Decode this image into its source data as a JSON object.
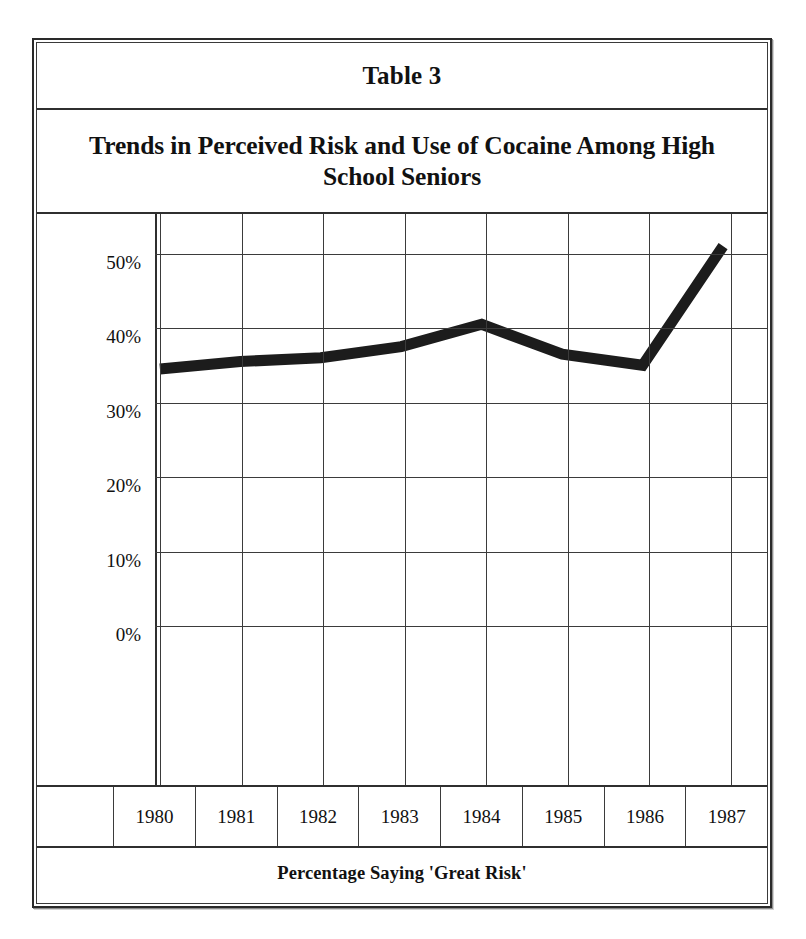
{
  "table": {
    "number_label": "Table 3",
    "title": "Trends in Perceived Risk and Use of Cocaine Among High School Seniors",
    "caption": "Percentage Saying 'Great Risk'"
  },
  "style": {
    "line_color": "#1c1c1c",
    "grid_color": "#3b3b3b",
    "border_color": "#2f2f2f",
    "background": "#ffffff",
    "line_width_px": 11
  },
  "chart_data": {
    "type": "line",
    "title": "Trends in Perceived Risk and Use of Cocaine Among High School Seniors",
    "subtitle": "Table 3",
    "xlabel": "Percentage Saying 'Great Risk'",
    "ylabel": "",
    "x": [
      "1980",
      "1981",
      "1982",
      "1983",
      "1984",
      "1985",
      "1986",
      "1987"
    ],
    "categories": [
      "1980",
      "1981",
      "1982",
      "1983",
      "1984",
      "1985",
      "1986",
      "1987"
    ],
    "values": [
      34.5,
      35.5,
      36.0,
      37.5,
      40.5,
      36.5,
      35.0,
      51.0
    ],
    "series": [
      {
        "name": "Percentage Saying 'Great Risk'",
        "values": [
          34.5,
          35.5,
          36.0,
          37.5,
          40.5,
          36.5,
          35.0,
          51.0
        ]
      }
    ],
    "ylim": [
      0,
      55
    ],
    "yticks": [
      0,
      10,
      20,
      30,
      40,
      50
    ],
    "ytick_labels": [
      "0%",
      "10%",
      "20%",
      "30%",
      "40%",
      "50%"
    ],
    "grid": true,
    "legend": "none",
    "annotations": []
  },
  "y_axis": {
    "ticks": [
      {
        "value": 50,
        "label": "50%"
      },
      {
        "value": 40,
        "label": "40%"
      },
      {
        "value": 30,
        "label": "30%"
      },
      {
        "value": 20,
        "label": "20%"
      },
      {
        "value": 10,
        "label": "10%"
      },
      {
        "value": 0,
        "label": "0%"
      }
    ]
  },
  "x_axis": {
    "years": [
      "1980",
      "1981",
      "1982",
      "1983",
      "1984",
      "1985",
      "1986",
      "1987"
    ]
  }
}
